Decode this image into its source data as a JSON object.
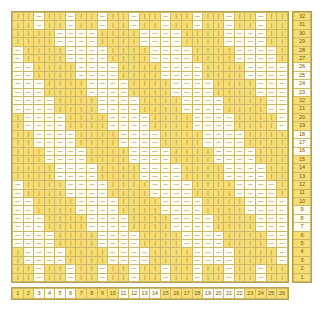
{
  "chart": {
    "columns": 26,
    "rows": 32,
    "colors": {
      "knit": "#f7dd74",
      "purl": "#fffdf0",
      "grid_line": "#cbb86a",
      "border": "#b5a24a",
      "text": "#6b5c18"
    },
    "symbols": {
      "knit": "|",
      "purl": "—"
    },
    "legend": {
      "knit_label": "knit",
      "purl_label": "purl"
    }
  },
  "column_numbers": {
    "labels": [
      "26",
      "25",
      "24",
      "23",
      "22",
      "21",
      "20",
      "19",
      "18",
      "17",
      "16",
      "15",
      "14",
      "13",
      "12",
      "11",
      "10",
      "9",
      "8",
      "7",
      "6",
      "5",
      "4",
      "3",
      "2",
      "1"
    ],
    "highlight": [
      true,
      true,
      true,
      true,
      false,
      false,
      false,
      false,
      true,
      true,
      true,
      true,
      false,
      false,
      false,
      false,
      true,
      true,
      true,
      true,
      false,
      false,
      false,
      false,
      true,
      true
    ]
  },
  "row_numbers": {
    "labels": [
      "32",
      "31",
      "30",
      "29",
      "28",
      "27",
      "26",
      "25",
      "24",
      "23",
      "22",
      "21",
      "20",
      "19",
      "18",
      "17",
      "16",
      "15",
      "14",
      "13",
      "12",
      "11",
      "10",
      "9",
      "8",
      "7",
      "6",
      "5",
      "4",
      "3",
      "2",
      "1"
    ],
    "highlight": [
      true,
      true,
      true,
      true,
      true,
      true,
      false,
      false,
      false,
      false,
      true,
      true,
      true,
      true,
      false,
      false,
      false,
      true,
      true,
      true,
      true,
      true,
      true,
      false,
      false,
      false,
      true,
      true,
      true,
      true,
      true,
      true
    ]
  },
  "chart_data": {
    "type": "heatmap",
    "xlabel": "Stitch",
    "ylabel": "Row",
    "x": [
      "1",
      "2",
      "3",
      "4",
      "5",
      "6",
      "7",
      "8",
      "9",
      "10",
      "11",
      "12",
      "13",
      "14",
      "15",
      "16",
      "17",
      "18",
      "19",
      "20",
      "21",
      "22",
      "23",
      "24",
      "25",
      "26"
    ],
    "y": [
      "32",
      "31",
      "30",
      "29",
      "28",
      "27",
      "26",
      "25",
      "24",
      "23",
      "22",
      "21",
      "20",
      "19",
      "18",
      "17",
      "16",
      "15",
      "14",
      "13",
      "12",
      "11",
      "10",
      "9",
      "8",
      "7",
      "6",
      "5",
      "4",
      "3",
      "2",
      "1"
    ],
    "legend": [
      "knit (yellow)",
      "purl (cream)"
    ],
    "grid": true,
    "cell_symbols": {
      "1": "|",
      "0": "—"
    },
    "matrix": [
      [
        1,
        1,
        0,
        1,
        1,
        0,
        1,
        1,
        0,
        1,
        1,
        0,
        1,
        1,
        0,
        1,
        1,
        0,
        1,
        1,
        0,
        1,
        1,
        0,
        1,
        1
      ],
      [
        1,
        1,
        0,
        1,
        1,
        0,
        1,
        1,
        0,
        1,
        1,
        0,
        1,
        1,
        0,
        1,
        1,
        0,
        1,
        1,
        0,
        1,
        1,
        0,
        1,
        1
      ],
      [
        1,
        1,
        1,
        1,
        0,
        0,
        0,
        0,
        1,
        1,
        1,
        1,
        0,
        0,
        0,
        0,
        1,
        1,
        1,
        1,
        0,
        0,
        0,
        0,
        1,
        1
      ],
      [
        1,
        1,
        1,
        1,
        0,
        0,
        0,
        0,
        1,
        1,
        1,
        1,
        0,
        0,
        0,
        0,
        1,
        1,
        1,
        1,
        0,
        0,
        0,
        0,
        1,
        1
      ],
      [
        0,
        1,
        1,
        1,
        1,
        0,
        0,
        0,
        0,
        1,
        1,
        1,
        1,
        0,
        0,
        0,
        0,
        1,
        1,
        1,
        1,
        0,
        0,
        0,
        0,
        1
      ],
      [
        0,
        1,
        1,
        1,
        1,
        0,
        0,
        0,
        0,
        1,
        1,
        1,
        1,
        0,
        0,
        0,
        0,
        1,
        1,
        1,
        1,
        0,
        0,
        0,
        0,
        1
      ],
      [
        0,
        0,
        1,
        1,
        1,
        1,
        0,
        0,
        0,
        0,
        1,
        1,
        1,
        1,
        0,
        0,
        0,
        0,
        1,
        1,
        1,
        1,
        0,
        0,
        0,
        0
      ],
      [
        0,
        0,
        1,
        1,
        1,
        1,
        0,
        0,
        0,
        0,
        1,
        1,
        1,
        1,
        0,
        0,
        0,
        0,
        1,
        1,
        1,
        1,
        0,
        0,
        0,
        0
      ],
      [
        0,
        0,
        0,
        1,
        1,
        1,
        1,
        0,
        0,
        0,
        0,
        1,
        1,
        1,
        1,
        0,
        0,
        0,
        0,
        1,
        1,
        1,
        1,
        0,
        0,
        0
      ],
      [
        0,
        0,
        0,
        1,
        1,
        1,
        1,
        0,
        0,
        0,
        0,
        1,
        1,
        1,
        1,
        0,
        0,
        0,
        0,
        1,
        1,
        1,
        1,
        0,
        0,
        0
      ],
      [
        0,
        0,
        0,
        0,
        1,
        1,
        1,
        1,
        0,
        0,
        0,
        0,
        1,
        1,
        1,
        1,
        0,
        0,
        0,
        0,
        1,
        1,
        1,
        1,
        0,
        0
      ],
      [
        0,
        0,
        0,
        0,
        1,
        1,
        1,
        1,
        0,
        0,
        0,
        0,
        1,
        1,
        1,
        1,
        0,
        0,
        0,
        0,
        1,
        1,
        1,
        1,
        0,
        0
      ],
      [
        1,
        0,
        0,
        0,
        0,
        1,
        1,
        1,
        1,
        0,
        0,
        0,
        0,
        1,
        1,
        1,
        1,
        0,
        0,
        0,
        0,
        1,
        1,
        1,
        1,
        0
      ],
      [
        1,
        0,
        0,
        0,
        0,
        1,
        1,
        1,
        1,
        0,
        0,
        0,
        0,
        1,
        1,
        1,
        1,
        0,
        0,
        0,
        0,
        1,
        1,
        1,
        1,
        0
      ],
      [
        1,
        1,
        0,
        0,
        0,
        0,
        1,
        1,
        1,
        1,
        0,
        0,
        0,
        0,
        1,
        1,
        1,
        1,
        0,
        0,
        0,
        0,
        1,
        1,
        1,
        1
      ],
      [
        1,
        1,
        0,
        0,
        0,
        0,
        1,
        1,
        1,
        1,
        0,
        0,
        0,
        0,
        1,
        1,
        1,
        1,
        0,
        0,
        0,
        0,
        1,
        1,
        1,
        1
      ],
      [
        1,
        1,
        1,
        0,
        0,
        0,
        0,
        1,
        1,
        1,
        1,
        0,
        0,
        0,
        0,
        1,
        1,
        1,
        1,
        0,
        0,
        0,
        0,
        1,
        1,
        1
      ],
      [
        1,
        1,
        1,
        0,
        0,
        0,
        0,
        1,
        1,
        1,
        1,
        0,
        0,
        0,
        0,
        1,
        1,
        1,
        1,
        0,
        0,
        0,
        0,
        1,
        1,
        1
      ],
      [
        1,
        1,
        1,
        1,
        0,
        0,
        0,
        0,
        1,
        1,
        1,
        1,
        0,
        0,
        0,
        0,
        1,
        1,
        1,
        1,
        0,
        0,
        0,
        0,
        1,
        1
      ],
      [
        1,
        1,
        1,
        1,
        0,
        0,
        0,
        0,
        1,
        1,
        1,
        1,
        0,
        0,
        0,
        0,
        1,
        1,
        1,
        1,
        0,
        0,
        0,
        0,
        1,
        1
      ],
      [
        0,
        1,
        1,
        1,
        1,
        0,
        0,
        0,
        0,
        1,
        1,
        1,
        1,
        0,
        0,
        0,
        0,
        1,
        1,
        1,
        1,
        0,
        0,
        0,
        0,
        1
      ],
      [
        0,
        1,
        1,
        1,
        1,
        0,
        0,
        0,
        0,
        1,
        1,
        1,
        1,
        0,
        0,
        0,
        0,
        1,
        1,
        1,
        1,
        0,
        0,
        0,
        0,
        1
      ],
      [
        0,
        0,
        1,
        1,
        1,
        1,
        0,
        0,
        0,
        0,
        1,
        1,
        1,
        1,
        0,
        0,
        0,
        0,
        1,
        1,
        1,
        1,
        0,
        0,
        0,
        0
      ],
      [
        0,
        0,
        1,
        1,
        1,
        1,
        0,
        0,
        0,
        0,
        1,
        1,
        1,
        1,
        0,
        0,
        0,
        0,
        1,
        1,
        1,
        1,
        0,
        0,
        0,
        0
      ],
      [
        0,
        0,
        0,
        1,
        1,
        1,
        1,
        0,
        0,
        0,
        0,
        1,
        1,
        1,
        1,
        0,
        0,
        0,
        0,
        1,
        1,
        1,
        1,
        0,
        0,
        0
      ],
      [
        0,
        0,
        0,
        1,
        1,
        1,
        1,
        0,
        0,
        0,
        0,
        1,
        1,
        1,
        1,
        0,
        0,
        0,
        0,
        1,
        1,
        1,
        1,
        0,
        0,
        0
      ],
      [
        0,
        0,
        0,
        0,
        1,
        1,
        1,
        1,
        0,
        0,
        0,
        0,
        1,
        1,
        1,
        1,
        0,
        0,
        0,
        0,
        1,
        1,
        1,
        1,
        0,
        0
      ],
      [
        0,
        0,
        0,
        0,
        1,
        1,
        1,
        1,
        0,
        0,
        0,
        0,
        1,
        1,
        1,
        1,
        0,
        0,
        0,
        0,
        1,
        1,
        1,
        1,
        0,
        0
      ],
      [
        1,
        0,
        0,
        0,
        0,
        1,
        1,
        1,
        1,
        0,
        0,
        0,
        0,
        1,
        1,
        1,
        1,
        0,
        0,
        0,
        0,
        1,
        1,
        1,
        1,
        0
      ],
      [
        1,
        0,
        0,
        0,
        0,
        1,
        1,
        1,
        1,
        0,
        0,
        0,
        0,
        1,
        1,
        1,
        1,
        0,
        0,
        0,
        0,
        1,
        1,
        1,
        1,
        0
      ],
      [
        1,
        1,
        0,
        1,
        1,
        0,
        1,
        1,
        0,
        1,
        1,
        0,
        1,
        1,
        0,
        1,
        1,
        0,
        1,
        1,
        0,
        1,
        1,
        0,
        1,
        1
      ],
      [
        1,
        1,
        0,
        1,
        1,
        0,
        1,
        1,
        0,
        1,
        1,
        0,
        1,
        1,
        0,
        1,
        1,
        0,
        1,
        1,
        0,
        1,
        1,
        0,
        1,
        1
      ]
    ]
  }
}
